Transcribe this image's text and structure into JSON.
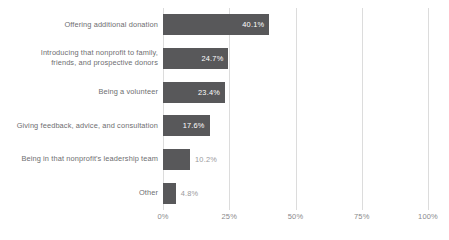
{
  "chart_data": {
    "type": "bar",
    "orientation": "horizontal",
    "title": "",
    "subtitle": "",
    "xlabel": "",
    "ylabel": "",
    "xlim": [
      0,
      100
    ],
    "grid": true,
    "legend": false,
    "bar_color": "#58585a",
    "gridline_color": "#dcdcdc",
    "inside_label_color": "#ffffff",
    "outside_label_color": "#9a9a9c",
    "tick_label_color": "#8a8a8c",
    "category_label_color": "#6e6e70",
    "xticks": [
      0,
      25,
      50,
      75,
      100
    ],
    "xticklabels": [
      "0%",
      "25%",
      "50%",
      "75%",
      "100%"
    ],
    "categories": [
      "Offering additional donation",
      "Introducing that nonprofit to family, friends, and prospective donors",
      "Being a volunteer",
      "Giving feedback, advice, and consultation",
      "Being in that nonprofit's leadership team",
      "Other"
    ],
    "values": [
      40.1,
      24.7,
      23.4,
      17.6,
      10.2,
      4.8
    ],
    "value_labels": [
      "40.1%",
      "24.7%",
      "23.4%",
      "17.6%",
      "10.2%",
      "4.8%"
    ],
    "label_placement": [
      "inside",
      "inside",
      "inside",
      "inside",
      "outside",
      "outside"
    ],
    "bars": [
      {
        "category": "Offering additional donation",
        "category_lines": [
          "Offering additional donation"
        ],
        "value": 40.1,
        "value_label": "40.1%",
        "label_placement": "inside"
      },
      {
        "category": "Introducing that nonprofit to family, friends, and prospective donors",
        "category_lines": [
          "Introducing that nonprofit to family,",
          "friends, and prospective donors"
        ],
        "value": 24.7,
        "value_label": "24.7%",
        "label_placement": "inside"
      },
      {
        "category": "Being a volunteer",
        "category_lines": [
          "Being a volunteer"
        ],
        "value": 23.4,
        "value_label": "23.4%",
        "label_placement": "inside"
      },
      {
        "category": "Giving feedback, advice, and consultation",
        "category_lines": [
          "Giving feedback, advice, and consultation"
        ],
        "value": 17.6,
        "value_label": "17.6%",
        "label_placement": "inside"
      },
      {
        "category": "Being in that nonprofit's leadership team",
        "category_lines": [
          "Being in that nonprofit's leadership team"
        ],
        "value": 10.2,
        "value_label": "10.2%",
        "label_placement": "outside"
      },
      {
        "category": "Other",
        "category_lines": [
          "Other"
        ],
        "value": 4.8,
        "value_label": "4.8%",
        "label_placement": "outside"
      }
    ]
  }
}
